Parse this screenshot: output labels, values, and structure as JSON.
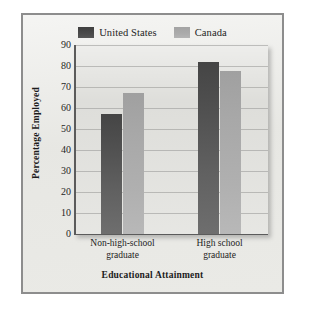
{
  "chart_data": {
    "type": "bar",
    "title": "",
    "xlabel": "Educational Attainment",
    "ylabel": "Percentage Employed",
    "categories": [
      "Non-high-school graduate",
      "High school graduate"
    ],
    "category_lines": [
      [
        "Non-high-school",
        "graduate"
      ],
      [
        "High school",
        "graduate"
      ]
    ],
    "series": [
      {
        "name": "United States",
        "values": [
          57,
          82
        ],
        "color": "#4a4a4a"
      },
      {
        "name": "Canada",
        "values": [
          67,
          77.5
        ],
        "color": "#a8a8a8"
      }
    ],
    "ylim": [
      0,
      90
    ],
    "ytick_step": 10,
    "yticks": [
      90,
      80,
      70,
      60,
      50,
      40,
      30,
      20,
      10,
      0
    ],
    "grid": true,
    "legend_position": "top-center"
  },
  "legend": {
    "entries": [
      {
        "label": "United States",
        "swatch": "swatch-us"
      },
      {
        "label": "Canada",
        "swatch": "swatch-ca"
      }
    ]
  },
  "colors": {
    "frame_border": "#8d8d8d",
    "figure_background": "#e8e8e4",
    "plot_background": "#dcdcd8",
    "axis": "#5b5b5b",
    "gridline": "#969694",
    "text": "#1c1c1c"
  }
}
